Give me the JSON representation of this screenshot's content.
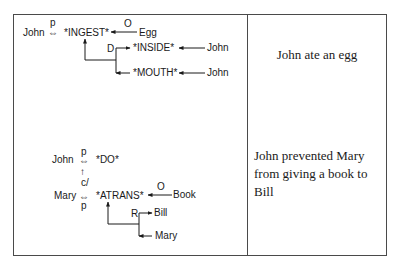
{
  "table": {
    "rows": [
      {
        "diagram": {
          "actor": "John",
          "actor_link_label": "p",
          "primitive": "*INGEST*",
          "object_label": "O",
          "object": "Egg",
          "direction_label": "D",
          "to": "*INSIDE*",
          "to_owner": "John",
          "from": "*MOUTH*",
          "from_owner": "John"
        },
        "caption": "John ate an egg"
      },
      {
        "diagram": {
          "actor": "John",
          "actor_link_label": "p",
          "primitive": "*DO*",
          "causal_label": "c/",
          "actor2": "Mary",
          "actor2_link_label": "p",
          "primitive2": "*ATRANS*",
          "object_label": "O",
          "object": "Book",
          "recipient_label": "R",
          "to": "Bill",
          "from": "Mary"
        },
        "caption": "John prevented Mary from giving a book to Bill"
      }
    ]
  },
  "symbols": {
    "two_way_link": "⇔",
    "causal_arrow": "↑"
  },
  "colors": {
    "ink": "#1a1a1a",
    "border": "#4a4a4a",
    "background": "#ffffff"
  }
}
